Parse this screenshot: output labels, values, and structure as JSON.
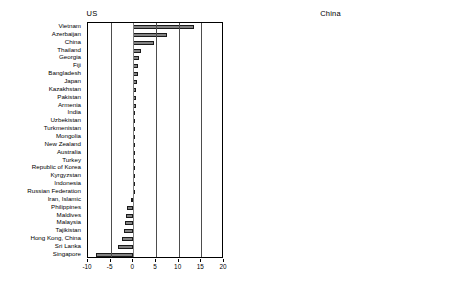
{
  "chart_data": [
    {
      "type": "bar",
      "orientation": "horizontal",
      "title": "US",
      "xlabel": "",
      "ylabel": "",
      "xlim": [
        -10,
        20
      ],
      "xticks": [
        -10,
        -5,
        0,
        5,
        10,
        15,
        20
      ],
      "xticklabels": [
        "-10",
        "-5",
        "0",
        "5",
        "10",
        "15",
        "20"
      ],
      "grid": true,
      "legend": "none",
      "categories": [
        "Vietnam",
        "Azerbaijan",
        "China",
        "Thailand",
        "Georgia",
        "Fiji",
        "Bangladesh",
        "Japan",
        "Kazakhstan",
        "Pakistan",
        "Armenia",
        "India",
        "Uzbekistan",
        "Turkmenistan",
        "Mongolia",
        "New Zealand",
        "Australia",
        "Turkey",
        "Republic of Korea",
        "Kyrgyzstan",
        "Indonesia",
        "Russian Federation",
        "Iran, Islamic",
        "Philippines",
        "Maldives",
        "Malaysia",
        "Tajikistan",
        "Hong Kong, China",
        "Sri Lanka",
        "Singapore"
      ],
      "values": [
        13.4,
        7.4,
        4.6,
        1.6,
        1.2,
        1.1,
        1.1,
        0.7,
        0.5,
        0.5,
        0.5,
        0.45,
        0.4,
        0.35,
        0.3,
        0.25,
        0.15,
        0.1,
        0.05,
        0.0,
        -0.05,
        -0.15,
        -0.5,
        -1.5,
        -1.6,
        -1.8,
        -2.1,
        -2.6,
        -3.4,
        -8.2
      ]
    },
    {
      "type": "bar",
      "orientation": "horizontal",
      "title": "China",
      "xlabel": "",
      "ylabel": "",
      "xlim": [
        -5,
        40
      ],
      "xticks": [
        -5,
        5,
        15,
        25,
        35
      ],
      "xticklabels": [
        "-5",
        "5",
        "15",
        "25",
        "35"
      ],
      "grid": true,
      "legend": "none",
      "categories": [
        "Hong Kong, China",
        "Mongolia",
        "Singapore",
        "Philippines",
        "Republic of Korea",
        "Malaysia",
        "Thailand",
        "Iran, Islamic",
        "Kazakhstan",
        "Vietnam",
        "Kyrgyzstan",
        "Japan",
        "Australia",
        "Indonesia",
        "India",
        "Uzbekistan",
        "New Zealand",
        "Pakistan",
        "Russian Federation",
        "Turkey",
        "Sri Lanka",
        "Georgia",
        "Armenia",
        "Bangladesh",
        "Turkmenistan",
        "Maldives",
        "Azerbaijan",
        "Fiji",
        "Tajikistan"
      ],
      "values": [
        38.5,
        23.0,
        14.8,
        14.0,
        9.4,
        6.6,
        5.6,
        3.0,
        2.7,
        1.5,
        1.3,
        1.3,
        1.0,
        1.0,
        1.0,
        0.9,
        0.8,
        0.8,
        0.5,
        0.4,
        0.35,
        0.3,
        0.3,
        0.25,
        0.2,
        0.2,
        0.15,
        0.6,
        -0.5
      ]
    }
  ]
}
